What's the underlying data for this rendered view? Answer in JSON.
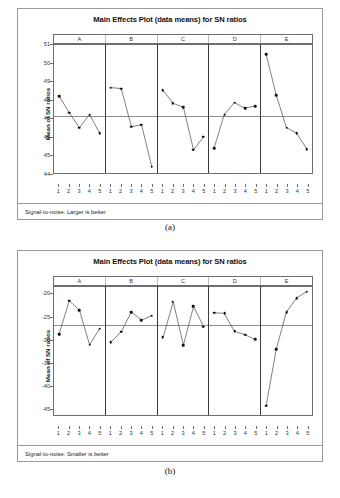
{
  "figures": [
    {
      "caption": "(a)",
      "title": "Main Effects Plot (data means) for SN ratios",
      "ylabel": "Mean of SN ratios",
      "footnote": "Signal-to-noise: Larger is better",
      "chart_data": {
        "type": "line",
        "title": "Main Effects Plot (data means) for SN ratios",
        "xlabel": "",
        "ylabel": "Mean of SN ratios",
        "ylim": [
          44,
          51
        ],
        "yticks": [
          51,
          50,
          49,
          48,
          47,
          46,
          45,
          44
        ],
        "ytick_labels": [
          "51",
          "50",
          "49",
          "48",
          "47",
          "46",
          "45",
          "44"
        ],
        "grid": false,
        "legend": "none",
        "reference_line": 47.1,
        "levels": [
          "1",
          "2",
          "3",
          "4",
          "5"
        ],
        "panels": [
          {
            "name": "A",
            "values": [
              48.2,
              47.3,
              46.5,
              47.2,
              46.2
            ]
          },
          {
            "name": "B",
            "values": [
              48.65,
              48.6,
              46.55,
              46.65,
              44.4
            ]
          },
          {
            "name": "C",
            "values": [
              48.5,
              47.8,
              47.6,
              45.3,
              46.0
            ]
          },
          {
            "name": "D",
            "values": [
              45.4,
              47.2,
              47.85,
              47.55,
              47.65
            ]
          },
          {
            "name": "E",
            "values": [
              50.45,
              48.25,
              46.5,
              46.2,
              45.35
            ]
          }
        ]
      }
    },
    {
      "caption": "(b)",
      "title": "Main Effects Plot (data means) for SN ratios",
      "ylabel": "Mean of SN ratios",
      "footnote": "Signal-to-noise: Smaller is better",
      "chart_data": {
        "type": "line",
        "title": "Main Effects Plot (data means) for SN ratios",
        "xlabel": "",
        "ylabel": "Mean of SN ratios",
        "ylim": [
          -46.5,
          -18.4
        ],
        "yticks": [
          -20,
          -25,
          -30,
          -35,
          -40,
          -45
        ],
        "ytick_labels": [
          "-20",
          "-25",
          "-30",
          "-35",
          "-40",
          "-45"
        ],
        "grid": false,
        "legend": "none",
        "reference_line": -26.9,
        "levels": [
          "1",
          "2",
          "3",
          "4",
          "5"
        ],
        "panels": [
          {
            "name": "A",
            "values": [
              -28.8,
              -21.6,
              -23.6,
              -31.1,
              -27.6
            ]
          },
          {
            "name": "B",
            "values": [
              -30.5,
              -28.3,
              -24.0,
              -25.8,
              -24.8
            ]
          },
          {
            "name": "C",
            "values": [
              -29.5,
              -21.8,
              -31.2,
              -22.8,
              -27.2
            ]
          },
          {
            "name": "D",
            "values": [
              -24.2,
              -24.3,
              -28.2,
              -28.9,
              -29.9
            ]
          },
          {
            "name": "E",
            "values": [
              -44.3,
              -32.1,
              -24.0,
              -21.0,
              -19.6
            ]
          }
        ]
      }
    }
  ],
  "style": {
    "marker_color": "#111111",
    "line_color": "#4a4a4a",
    "frame_color": "#9a9a9a",
    "axis_color": "#6e6e6e",
    "reference_line_color": "#8e8e8e"
  }
}
